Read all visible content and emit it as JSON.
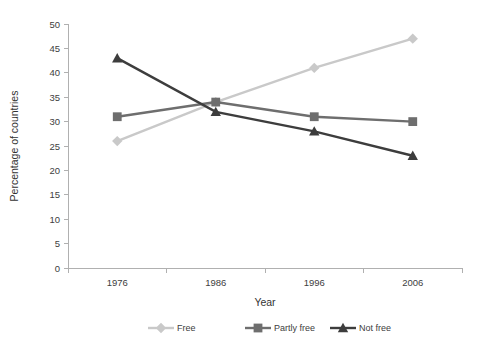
{
  "chart_data": {
    "type": "line",
    "title": "",
    "xlabel": "Year",
    "ylabel": "Percentage of countries",
    "categories": [
      "1976",
      "1986",
      "1996",
      "2006"
    ],
    "x": [
      1976,
      1986,
      1996,
      2006
    ],
    "ylim": [
      0,
      50
    ],
    "y_ticks": [
      0,
      5,
      10,
      15,
      20,
      25,
      30,
      35,
      40,
      45,
      50
    ],
    "y_tick_labels": [
      "0",
      "5",
      "10",
      "15",
      "20",
      "25",
      "30",
      "35",
      "40",
      "45",
      "50"
    ],
    "grid": false,
    "legend_position": "bottom",
    "series": [
      {
        "name": "Free",
        "values": [
          26,
          34,
          41,
          47
        ],
        "color": "#c9c9c9",
        "marker": "diamond"
      },
      {
        "name": "Partly free",
        "values": [
          31,
          34,
          31,
          30
        ],
        "color": "#6e6e6e",
        "marker": "square"
      },
      {
        "name": "Not free",
        "values": [
          43,
          32,
          28,
          23
        ],
        "color": "#3d3d3d",
        "marker": "triangle"
      }
    ]
  },
  "axes": {
    "axis_color": "#b0b0b0",
    "label_color": "#404040"
  },
  "legend": {
    "items": [
      {
        "label": "Free"
      },
      {
        "label": "Partly free"
      },
      {
        "label": "Not free"
      }
    ]
  }
}
